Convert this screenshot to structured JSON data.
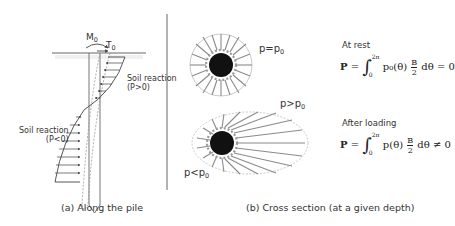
{
  "panel_a": {
    "moment_label": "M",
    "moment_sub": "0",
    "shear_label": "T",
    "shear_sub": "0",
    "soil_reaction_pos": "Soil reaction",
    "soil_reaction_pos_cond": "(P>0)",
    "soil_reaction_neg": "Soil reaction",
    "soil_reaction_neg_cond": "(P<0)",
    "caption": "(a) Along the pile"
  },
  "panel_b": {
    "rest_label": "p=p",
    "rest_sub": "0",
    "greater_label": "p>p",
    "greater_sub": "0",
    "less_label": "p<p",
    "less_sub": "0",
    "caption": "(b) Cross section (at a given depth)"
  },
  "equations": {
    "rest_title": "At rest",
    "rest_lhs": "P",
    "rest_upper": "2π",
    "rest_lower": "0",
    "rest_integrand": "p₀(θ)",
    "rest_num": "B",
    "rest_den": "2",
    "rest_rhs": "dθ = 0",
    "loading_title": "After loading",
    "loading_lhs": "P",
    "loading_upper": "2π",
    "loading_lower": "0",
    "loading_integrand": "p(θ)",
    "loading_num": "B",
    "loading_den": "2",
    "loading_rhs": "dθ ≠ 0"
  },
  "colors": {
    "line": "#555555",
    "ray": "#8a8a8a",
    "pile_core": "#111111",
    "dashed": "#aaaaaa"
  }
}
